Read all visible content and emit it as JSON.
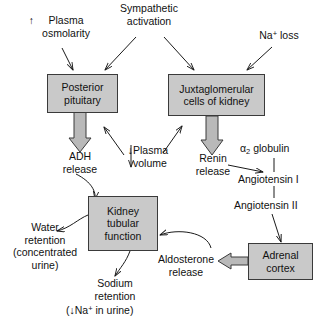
{
  "diagram": {
    "boxes": [
      {
        "id": "posterior-pituitary",
        "label": "Posterior\npituitary"
      },
      {
        "id": "juxtaglomerular",
        "label": "Juxtaglomerular\ncells of kidney"
      },
      {
        "id": "kidney-tubular",
        "label": "Kidney\ntubular\nfunction"
      },
      {
        "id": "adrenal-cortex",
        "label": "Adrenal\ncortex"
      }
    ],
    "labels": {
      "plasma_osmolarity": "Plasma\nosmolarity",
      "plasma_osmolarity_arrow": "↑",
      "sympathetic_activation": "Sympathetic\nactivation",
      "na_loss_prefix": "Na",
      "na_loss_sup": "+",
      "na_loss_suffix": " loss",
      "adh_release": "ADH\nrelease",
      "plasma_volume": "Plasma\nvolume",
      "plasma_volume_arrow": "↓",
      "renin_release": "Renin\nrelease",
      "alpha2_prefix": "α",
      "alpha2_sub": "2",
      "alpha2_suffix": " globulin",
      "angiotensin_1": "Angiotensin I",
      "angiotensin_2": "Angiotensin II",
      "water_retention": "Water\nretention\n(concentrated\nurine)",
      "sodium_retention": "Sodium\nretention",
      "na_in_urine_open": "(",
      "na_in_urine_arrow": "↓",
      "na_in_urine_prefix": "Na",
      "na_in_urine_sup": "+",
      "na_in_urine_suffix": " in urine)",
      "aldosterone_release": "Aldosterone\nrelease"
    },
    "colors": {
      "box_fill": "#c9c9c9",
      "box_stroke": "#3a3a3a",
      "line": "#1a1a1a",
      "block_arrow_fill": "#b9b9b9",
      "background": "#ffffff",
      "text": "#111111"
    }
  }
}
